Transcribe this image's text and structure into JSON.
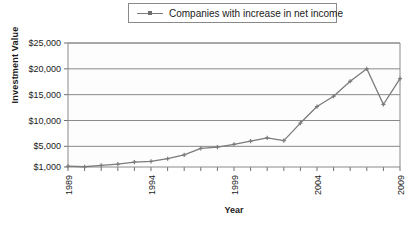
{
  "legend": {
    "entries": [
      {
        "label": "Companies with increase in net income",
        "color": "#7b7b7b",
        "marker": "cross"
      }
    ]
  },
  "axis": {
    "ylabel": "Investment Value",
    "xlabel": "Year"
  },
  "chart_data": {
    "type": "line",
    "title": "",
    "xlabel": "Year",
    "ylabel": "Investment Value",
    "xlim": [
      1989,
      2009
    ],
    "ylim": [
      1000,
      25000
    ],
    "ytick_labels": [
      "$1,000",
      "$5,000",
      "$10,000",
      "$15,000",
      "$20,000",
      "$25,000"
    ],
    "ytick_values": [
      1000,
      5000,
      10000,
      15000,
      20000,
      25000
    ],
    "xtick_labels": [
      "1989",
      "1994",
      "1999",
      "2004",
      "2009"
    ],
    "xtick_values": [
      1989,
      1994,
      1999,
      2004,
      2009
    ],
    "x_minor_ticks_every": 1,
    "grid": "horizontal",
    "legend_position": "top-center",
    "x": [
      1989,
      1990,
      1991,
      1992,
      1993,
      1994,
      1995,
      1996,
      1997,
      1998,
      1999,
      2000,
      2001,
      2002,
      2003,
      2004,
      2005,
      2006,
      2007,
      2008,
      2009
    ],
    "series": [
      {
        "name": "Companies with increase in net income",
        "color": "#7b7b7b",
        "marker": "cross",
        "values": [
          1150,
          1050,
          1300,
          1550,
          1950,
          2100,
          2600,
          3350,
          4600,
          4850,
          5400,
          6000,
          6650,
          6100,
          9500,
          12700,
          14700,
          17600,
          20000,
          13100,
          18100
        ]
      }
    ]
  }
}
